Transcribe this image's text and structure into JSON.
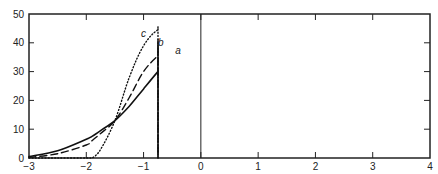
{
  "chart_data": {
    "type": "line",
    "title": "",
    "xlabel": "",
    "ylabel": "",
    "xlim": [
      -3,
      4
    ],
    "ylim": [
      0,
      50
    ],
    "grid": false,
    "legend": "inline labels near peaks",
    "x_ticks": [
      -3,
      -2,
      -1,
      0,
      1,
      2,
      3,
      4
    ],
    "y_ticks": [
      0,
      10,
      20,
      30,
      40,
      50
    ],
    "x_tick_labels": [
      "-3",
      "-2",
      "-1",
      "0",
      "1",
      "2",
      "3",
      "4"
    ],
    "y_tick_labels": [
      "0",
      "10",
      "20",
      "30",
      "40",
      "50"
    ],
    "reference_line": {
      "x": 0,
      "style": "solid vertical"
    },
    "x": [
      -3.0,
      -2.5,
      -2.0,
      -1.9,
      -1.75,
      -1.5,
      -1.25,
      -1.0,
      -0.75,
      -0.5,
      -0.25,
      0.0,
      0.25,
      0.5,
      0.75,
      1.0,
      1.25,
      1.5,
      1.75,
      2.0,
      2.25,
      2.5,
      2.75,
      3.0,
      3.5,
      4.0
    ],
    "series": [
      {
        "name": "a",
        "style": "solid",
        "values": [
          0.5,
          2.5,
          6.5,
          7.5,
          9.5,
          13.0,
          18.0,
          24.0,
          30.0,
          35.5,
          39.0,
          40.0,
          39.0,
          36.0,
          31.5,
          26.0,
          20.0,
          14.5,
          9.5,
          6.0,
          3.5,
          1.5,
          0.5,
          0.1,
          0.0,
          0.0
        ]
      },
      {
        "name": "b",
        "style": "dashed",
        "values": [
          0.2,
          1.5,
          4.5,
          6.0,
          8.5,
          13.0,
          21.0,
          30.0,
          35.5,
          39.5,
          41.0,
          40.5,
          37.5,
          33.0,
          27.5,
          21.5,
          16.0,
          11.5,
          8.0,
          6.0,
          4.0,
          2.5,
          1.5,
          0.8,
          0.3,
          0.1
        ]
      },
      {
        "name": "c",
        "style": "dotted",
        "values": [
          0.0,
          0.0,
          0.0,
          0.0,
          3.0,
          13.0,
          28.0,
          39.0,
          44.5,
          45.5,
          44.0,
          41.0,
          36.0,
          30.0,
          23.5,
          17.0,
          12.0,
          9.0,
          6.5,
          5.0,
          3.5,
          2.5,
          1.5,
          1.0,
          0.5,
          0.3
        ]
      }
    ],
    "annotations": [
      {
        "text": "a",
        "x": -0.4,
        "y": 36
      },
      {
        "text": "b",
        "x": -0.7,
        "y": 39
      },
      {
        "text": "c",
        "x": -1.0,
        "y": 42
      }
    ]
  }
}
